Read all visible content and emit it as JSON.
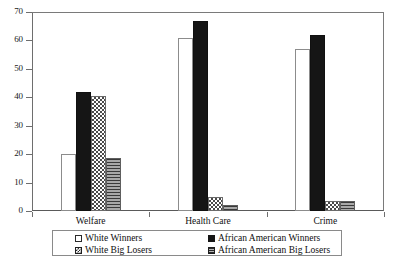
{
  "chart_data": {
    "type": "bar",
    "title": "",
    "subtitle": "",
    "xlabel": "",
    "ylabel": "",
    "ylim": [
      0,
      70
    ],
    "yticks": [
      0,
      10,
      20,
      30,
      40,
      50,
      60,
      70
    ],
    "ytick_labels": [
      "0",
      "10",
      "20",
      "30",
      "40",
      "50",
      "60",
      "70"
    ],
    "grid": false,
    "legend_position": "bottom",
    "categories": [
      "Welfare",
      "Health Care",
      "Crime"
    ],
    "series": [
      {
        "name": "White Winners",
        "fill": "open",
        "color": "#ffffff",
        "values": [
          20,
          61,
          57
        ]
      },
      {
        "name": "African American Winners",
        "fill": "solid",
        "color": "#151515",
        "values": [
          42,
          67,
          62
        ]
      },
      {
        "name": "White Big Losers",
        "fill": "checkerboard",
        "color": "#4a4a4a",
        "values": [
          40.5,
          5,
          3.5
        ]
      },
      {
        "name": "African American Big Losers",
        "fill": "horizontal-lines",
        "color": "#8d8d8d",
        "values": [
          18.5,
          2,
          3.5
        ]
      }
    ]
  },
  "legend": {
    "entries": [
      {
        "label": "White Winners"
      },
      {
        "label": "White Big Losers"
      },
      {
        "label": "African American Winners"
      },
      {
        "label": "African American Big Losers"
      }
    ]
  }
}
